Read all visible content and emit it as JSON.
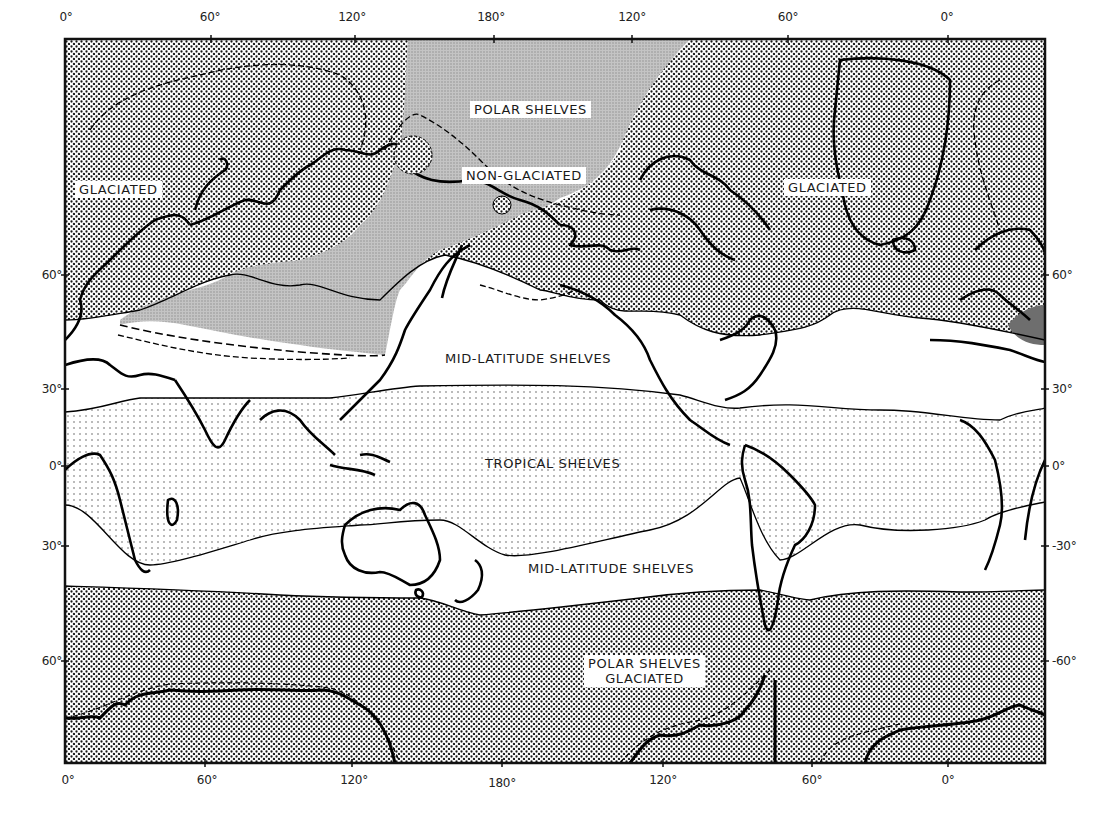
{
  "map": {
    "colors": {
      "frame": "#111111",
      "glaciated_dots": "#1a1a1a",
      "non_glaciated_gray": "#b9b9b9",
      "tropical_dots": "#555555",
      "mid_latitude": "#ffffff",
      "coastline": "#000000"
    },
    "top_axis_labels": [
      {
        "text": "0°",
        "x": 66
      },
      {
        "text": "60°",
        "x": 210
      },
      {
        "text": "120°",
        "x": 352
      },
      {
        "text": "180°",
        "x": 491
      },
      {
        "text": "120°",
        "x": 632
      },
      {
        "text": "60°",
        "x": 788
      },
      {
        "text": "0°",
        "x": 947
      }
    ],
    "bottom_axis_labels": [
      {
        "text": "0°",
        "x": 68
      },
      {
        "text": "60°",
        "x": 207
      },
      {
        "text": "120°",
        "x": 354
      },
      {
        "text": "180°",
        "x": 502
      },
      {
        "text": "120°",
        "x": 663
      },
      {
        "text": "60°",
        "x": 812
      },
      {
        "text": "0°",
        "x": 948
      }
    ],
    "left_axis_labels": [
      {
        "text": "60°",
        "y": 275
      },
      {
        "text": "30°",
        "y": 389
      },
      {
        "text": "0°",
        "y": 466
      },
      {
        "text": "30°",
        "y": 546
      },
      {
        "text": "60°",
        "y": 661
      }
    ],
    "right_axis_labels": [
      {
        "text": "60°",
        "y": 275
      },
      {
        "text": "30°",
        "y": 389
      },
      {
        "text": "0°",
        "y": 466
      },
      {
        "text": "-30°",
        "y": 546
      },
      {
        "text": "-60°",
        "y": 661
      }
    ],
    "region_labels": {
      "polar_shelves_north": "POLAR SHELVES",
      "non_glaciated": "NON-GLACIATED",
      "glaciated_west": "GLACIATED",
      "glaciated_east": "GLACIATED",
      "mid_latitude_north": "MID-LATITUDE SHELVES",
      "tropical": "TROPICAL SHELVES",
      "mid_latitude_south": "MID-LATITUDE SHELVES",
      "polar_shelves_south_line1": "POLAR SHELVES",
      "polar_shelves_south_line2": "GLACIATED"
    }
  }
}
